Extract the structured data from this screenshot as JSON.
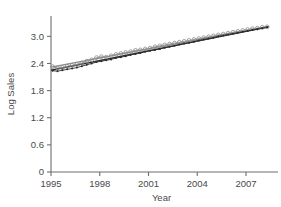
{
  "chart_data": {
    "type": "scatter",
    "title": "",
    "xlabel": "Year",
    "ylabel": "Log Sales",
    "xlim": [
      1995,
      2008.6
    ],
    "ylim": [
      0,
      3.45
    ],
    "grid": false,
    "legend": null,
    "x_ticks": [
      1995,
      1998,
      2001,
      2004,
      2007
    ],
    "x_tick_labels": [
      "1995",
      "1998",
      "2001",
      "2004",
      "2007"
    ],
    "y_ticks": [
      0,
      0.6,
      1.2,
      1.8,
      2.4,
      3.0
    ],
    "y_tick_labels": [
      "0",
      "0.6",
      "1.2",
      "1.8",
      "2.4",
      "3.0"
    ],
    "series": [
      {
        "name": "observed-upper",
        "marker": "open-circle",
        "color": "#8c8c8c",
        "x": [
          1995.1,
          1995.4,
          1995.7,
          1996.0,
          1996.3,
          1996.6,
          1996.9,
          1997.2,
          1997.5,
          1997.8,
          1998.1,
          1998.4,
          1998.7,
          1999.0,
          1999.3,
          1999.6,
          1999.9,
          2000.2,
          2000.5,
          2000.8,
          2001.1,
          2001.4,
          2001.7,
          2002.0,
          2002.3,
          2002.6,
          2002.9,
          2003.2,
          2003.5,
          2003.8,
          2004.1,
          2004.4,
          2004.7,
          2005.0,
          2005.3,
          2005.6,
          2005.9,
          2006.2,
          2006.5,
          2006.8,
          2007.1,
          2007.4,
          2007.7,
          2008.0,
          2008.3
        ],
        "y": [
          2.33,
          2.3,
          2.31,
          2.34,
          2.36,
          2.38,
          2.41,
          2.45,
          2.48,
          2.53,
          2.55,
          2.54,
          2.57,
          2.6,
          2.62,
          2.64,
          2.66,
          2.69,
          2.7,
          2.72,
          2.74,
          2.77,
          2.79,
          2.81,
          2.83,
          2.85,
          2.87,
          2.89,
          2.91,
          2.93,
          2.95,
          2.97,
          2.99,
          3.01,
          3.03,
          3.05,
          3.07,
          3.09,
          3.11,
          3.13,
          3.15,
          3.17,
          3.18,
          3.2,
          3.21
        ]
      },
      {
        "name": "observed-lower",
        "marker": "filled-dot",
        "color": "#2b2b2b",
        "x": [
          1995.1,
          1995.4,
          1995.7,
          1996.0,
          1996.3,
          1996.6,
          1996.9,
          1997.2,
          1997.5,
          1997.8,
          1998.1,
          1998.4,
          1998.7,
          1999.0,
          1999.3,
          1999.6,
          1999.9,
          2000.2,
          2000.5,
          2000.8,
          2001.1,
          2001.4,
          2001.7,
          2002.0,
          2002.3,
          2002.6,
          2002.9,
          2003.2,
          2003.5,
          2003.8,
          2004.1,
          2004.4,
          2004.7,
          2005.0,
          2005.3,
          2005.6,
          2005.9,
          2006.2,
          2006.5,
          2006.8,
          2007.1,
          2007.4,
          2007.7,
          2008.0,
          2008.3
        ],
        "y": [
          2.24,
          2.23,
          2.25,
          2.27,
          2.29,
          2.31,
          2.34,
          2.37,
          2.4,
          2.43,
          2.45,
          2.47,
          2.49,
          2.52,
          2.54,
          2.56,
          2.59,
          2.61,
          2.63,
          2.66,
          2.68,
          2.7,
          2.72,
          2.75,
          2.77,
          2.79,
          2.82,
          2.84,
          2.86,
          2.88,
          2.91,
          2.93,
          2.95,
          2.97,
          3.0,
          3.02,
          3.04,
          3.06,
          3.08,
          3.1,
          3.12,
          3.14,
          3.16,
          3.18,
          3.2
        ]
      }
    ],
    "trend_lines": [
      {
        "name": "fit-upper",
        "color": "#8c8c8c",
        "x": [
          1995.0,
          2008.4
        ],
        "y": [
          2.32,
          3.22
        ]
      },
      {
        "name": "fit-lower",
        "color": "#2b2b2b",
        "x": [
          1995.0,
          2008.4
        ],
        "y": [
          2.25,
          3.21
        ]
      }
    ]
  },
  "colors": {
    "axis": "#6e6e6e",
    "text": "#4a4a4a",
    "upper_series": "#8c8c8c",
    "lower_series": "#2b2b2b",
    "background": "#ffffff"
  }
}
